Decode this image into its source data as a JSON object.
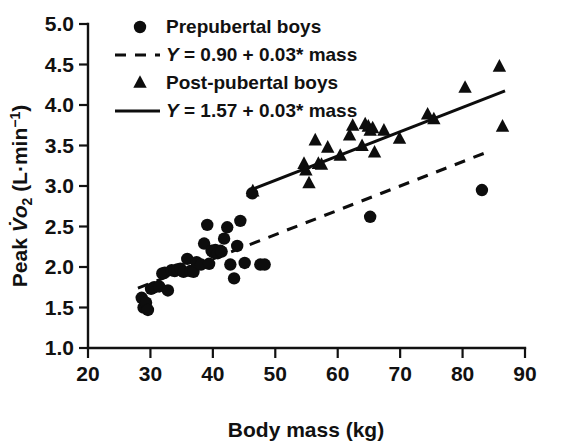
{
  "chart_data": {
    "type": "scatter",
    "title": "",
    "xlabel": "Body mass (kg)",
    "ylabel": "Peak V̇o2 (L·min−1)",
    "ylabel_parts": {
      "prefix": "Peak ",
      "v_dot": "V̇",
      "o_letter": "o",
      "o_subscript": "2",
      "units_open": " (L·min",
      "units_exponent": "−1",
      "units_close": ")"
    },
    "xlim": [
      20,
      90
    ],
    "ylim": [
      1.0,
      5.0
    ],
    "xticks": [
      20,
      30,
      40,
      50,
      60,
      70,
      80,
      90
    ],
    "yticks": [
      1.0,
      1.5,
      2.0,
      2.5,
      3.0,
      3.5,
      4.0,
      4.5,
      5.0
    ],
    "xtick_labels": [
      "20",
      "30",
      "40",
      "50",
      "60",
      "70",
      "80",
      "90"
    ],
    "ytick_labels": [
      "1.0",
      "1.5",
      "2.0",
      "2.5",
      "3.0",
      "3.5",
      "4.0",
      "4.5",
      "5.0"
    ],
    "grid": false,
    "legend_position": "top-left-inside",
    "marker_color": "#0d0d0d",
    "axis_color": "#111111",
    "series": [
      {
        "name": "Prepubertal boys",
        "marker": "circle",
        "points": [
          [
            28.6,
            1.62
          ],
          [
            28.9,
            1.5
          ],
          [
            29.3,
            1.56
          ],
          [
            29.6,
            1.47
          ],
          [
            30.1,
            1.73
          ],
          [
            30.6,
            1.75
          ],
          [
            31.4,
            1.76
          ],
          [
            31.9,
            1.92
          ],
          [
            32.3,
            1.93
          ],
          [
            32.8,
            1.71
          ],
          [
            33.4,
            1.96
          ],
          [
            33.9,
            1.95
          ],
          [
            34.3,
            1.97
          ],
          [
            34.8,
            1.98
          ],
          [
            35.3,
            1.94
          ],
          [
            35.9,
            2.1
          ],
          [
            36.4,
            1.95
          ],
          [
            36.9,
            1.94
          ],
          [
            37.4,
            2.06
          ],
          [
            38.1,
            2.03
          ],
          [
            38.6,
            2.29
          ],
          [
            39.1,
            2.52
          ],
          [
            39.4,
            2.04
          ],
          [
            39.8,
            2.2
          ],
          [
            40.1,
            2.18
          ],
          [
            40.4,
            2.21
          ],
          [
            40.8,
            2.17
          ],
          [
            41.2,
            2.2
          ],
          [
            41.4,
            2.19
          ],
          [
            41.8,
            2.35
          ],
          [
            42.3,
            2.49
          ],
          [
            42.8,
            2.03
          ],
          [
            43.4,
            1.86
          ],
          [
            43.9,
            2.26
          ],
          [
            44.4,
            2.57
          ],
          [
            45.1,
            2.05
          ],
          [
            46.3,
            2.91
          ],
          [
            47.6,
            2.03
          ],
          [
            48.3,
            2.03
          ],
          [
            65.2,
            2.62
          ],
          [
            83.1,
            2.95
          ]
        ]
      },
      {
        "name": "Post-pubertal boys",
        "marker": "triangle",
        "points": [
          [
            46.4,
            2.93
          ],
          [
            54.6,
            3.27
          ],
          [
            54.9,
            3.19
          ],
          [
            55.4,
            3.03
          ],
          [
            56.4,
            3.56
          ],
          [
            56.9,
            3.27
          ],
          [
            57.4,
            3.26
          ],
          [
            58.4,
            3.47
          ],
          [
            60.4,
            3.37
          ],
          [
            61.9,
            3.62
          ],
          [
            62.4,
            3.74
          ],
          [
            63.9,
            3.49
          ],
          [
            64.4,
            3.76
          ],
          [
            64.9,
            3.73
          ],
          [
            65.2,
            3.68
          ],
          [
            65.6,
            3.71
          ],
          [
            65.9,
            3.41
          ],
          [
            67.4,
            3.68
          ],
          [
            69.9,
            3.58
          ],
          [
            74.4,
            3.88
          ],
          [
            75.4,
            3.82
          ],
          [
            80.4,
            4.21
          ],
          [
            85.9,
            4.47
          ],
          [
            86.4,
            3.73
          ]
        ]
      }
    ],
    "fit_lines": [
      {
        "name": "Prepubertal regression",
        "style": "dashed",
        "equation_parts": {
          "y": "Y",
          "eq": " = 0.90 + 0.03* mass"
        },
        "intercept": 0.9,
        "slope": 0.03,
        "x_start": 28.0,
        "x_end": 84.4
      },
      {
        "name": "Post-pubertal regression",
        "style": "solid",
        "equation_parts": {
          "y": "Y",
          "eq": " = 1.57 + 0.03* mass"
        },
        "intercept": 1.57,
        "slope": 0.03,
        "x_start": 46.4,
        "x_end": 86.8
      }
    ],
    "legend": [
      {
        "marker": "circle",
        "label_plain": "Prepubertal boys",
        "italic_lead": "",
        "rest": "Prepubertal boys"
      },
      {
        "marker": "dashed-line",
        "label_plain": "Y = 0.90 + 0.03* mass",
        "italic_lead": "Y",
        "rest": " = 0.90 + 0.03* mass"
      },
      {
        "marker": "triangle",
        "label_plain": "Post-pubertal boys",
        "italic_lead": "",
        "rest": "Post-pubertal boys"
      },
      {
        "marker": "solid-line",
        "label_plain": "Y = 1.57 + 0.03* mass",
        "italic_lead": "Y",
        "rest": " = 1.57 + 0.03* mass"
      }
    ]
  }
}
